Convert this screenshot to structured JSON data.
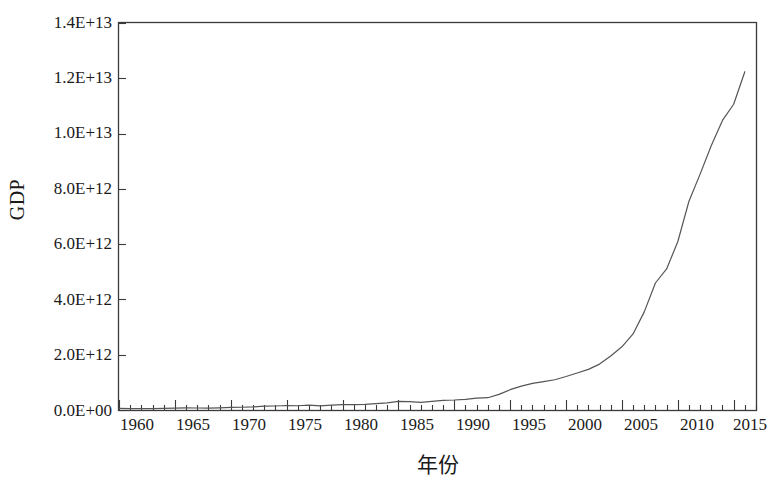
{
  "chart_data": {
    "type": "line",
    "title": "",
    "xlabel": "年份",
    "ylabel": "GDP",
    "xlim": [
      1960,
      2017
    ],
    "ylim": [
      0,
      14000000000000
    ],
    "grid": false,
    "legend": false,
    "x_tick_labels": [
      "1960",
      "1965",
      "1970",
      "1975",
      "1980",
      "1985",
      "1990",
      "1995",
      "2000",
      "2005",
      "2010",
      "2015"
    ],
    "x_tick_values": [
      1960,
      1965,
      1970,
      1975,
      1980,
      1985,
      1990,
      1995,
      2000,
      2005,
      2010,
      2015
    ],
    "y_tick_labels": [
      "0.0E+00",
      "2.0E+12",
      "4.0E+12",
      "6.0E+12",
      "8.0E+12",
      "1.0E+13",
      "1.2E+13",
      "1.4E+13"
    ],
    "y_tick_values": [
      0,
      2000000000000,
      4000000000000,
      6000000000000,
      8000000000000,
      10000000000000,
      12000000000000,
      14000000000000
    ],
    "x_minor_tick_step": 1,
    "line_color": "#555555",
    "line_width": 1.2,
    "series": [
      {
        "name": "GDP",
        "x": [
          1960,
          1961,
          1962,
          1963,
          1964,
          1965,
          1966,
          1967,
          1968,
          1969,
          1970,
          1971,
          1972,
          1973,
          1974,
          1975,
          1976,
          1977,
          1978,
          1979,
          1980,
          1981,
          1982,
          1983,
          1984,
          1985,
          1986,
          1987,
          1988,
          1989,
          1990,
          1991,
          1992,
          1993,
          1994,
          1995,
          1996,
          1997,
          1998,
          1999,
          2000,
          2001,
          2002,
          2003,
          2004,
          2005,
          2006,
          2007,
          2008,
          2009,
          2010,
          2011,
          2012,
          2013,
          2014,
          2015,
          2016
        ],
        "values": [
          59716467625,
          50056868958,
          47209359006,
          50706799903,
          59708343489,
          70436266146,
          76720285970,
          72881631327,
          70846535056,
          79705906247,
          92602973146,
          99801397665,
          113687640723,
          138544145279,
          144182173463,
          163431853505,
          153940645920,
          174938499699,
          149540715150,
          178279197855,
          191149448982,
          195866397863,
          205089053190,
          230686788892,
          259946586204,
          309488343579,
          300757708677,
          272972596913,
          312353903127,
          347767206323,
          360857912349,
          383373320979,
          426915712484,
          444731282376,
          564324670015,
          734547867135,
          863746717380,
          961603679330,
          1029043031153,
          1093997891322,
          1211346869605,
          1339395718865,
          1470549530720,
          1660287965662,
          1955347004963,
          2285965892360,
          2752119225736,
          3550342665152,
          4594306848763,
          5101702432883,
          6087164527421,
          7551500425597,
          8532230724141,
          9570405758739,
          10475682920527,
          11061553079876,
          12237700479375
        ]
      }
    ],
    "notable_points": {
      "start_year_value": "5.97E+10",
      "end_year_value": "1.22E+13",
      "peak_value": "1.22E+13"
    }
  },
  "axes": {
    "y_axis_label": "GDP",
    "x_axis_label": "年份"
  }
}
